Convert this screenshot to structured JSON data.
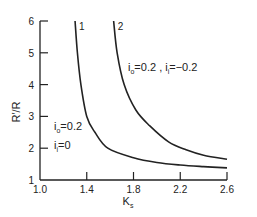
{
  "chart_data": {
    "type": "line",
    "title": "",
    "xlabel": "K",
    "xlabel_sub": "s",
    "ylabel": "R′/R",
    "xlim": [
      1.0,
      2.6
    ],
    "ylim": [
      1,
      6
    ],
    "x_ticks": [
      "1.0",
      "1.4",
      "1.8",
      "2.2",
      "2.6"
    ],
    "y_ticks": [
      "1",
      "2",
      "3",
      "4",
      "5",
      "6"
    ],
    "grid": false,
    "series": [
      {
        "name": "1",
        "label": "1",
        "condition": "i_o=0.2, i_i=0",
        "points": [
          [
            1.3,
            6.0
          ],
          [
            1.32,
            5.0
          ],
          [
            1.35,
            4.0
          ],
          [
            1.4,
            3.0
          ],
          [
            1.47,
            2.5
          ],
          [
            1.58,
            2.0
          ],
          [
            1.8,
            1.7
          ],
          [
            2.0,
            1.55
          ],
          [
            2.2,
            1.47
          ],
          [
            2.4,
            1.42
          ],
          [
            2.6,
            1.38
          ]
        ]
      },
      {
        "name": "2",
        "label": "2",
        "condition": "i_o=0.2, i_i=-0.2",
        "points": [
          [
            1.63,
            6.0
          ],
          [
            1.66,
            5.0
          ],
          [
            1.72,
            4.0
          ],
          [
            1.82,
            3.2
          ],
          [
            1.94,
            2.7
          ],
          [
            2.1,
            2.2
          ],
          [
            2.25,
            1.95
          ],
          [
            2.4,
            1.78
          ],
          [
            2.6,
            1.65
          ]
        ]
      }
    ],
    "annotations": [
      {
        "text_main": "i",
        "text_sub": "o",
        "text_rest": "=0.2 ,  i",
        "text_sub2": "i",
        "text_rest2": "=−0.2",
        "refers_to": "2"
      },
      {
        "text_main": "i",
        "text_sub": "o",
        "text_rest": "=0.2",
        "refers_to": "1"
      },
      {
        "text_main": "i",
        "text_sub": "i",
        "text_rest": "=0",
        "refers_to": "1"
      }
    ]
  }
}
